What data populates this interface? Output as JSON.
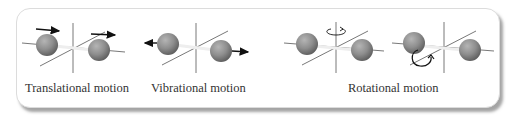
{
  "labels": {
    "translational": "Translational motion",
    "vibrational": "Vibrational motion",
    "rotational": "Rotational motion"
  },
  "colors": {
    "sphere": "#8a8a8a",
    "axis": "#555555",
    "arrow": "#111111",
    "panel_border": "#dcdcdc"
  }
}
